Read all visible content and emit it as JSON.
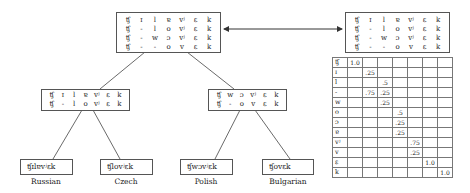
{
  "root_alignment": {
    "rows": [
      [
        "ʧ",
        "ɪ",
        "l",
        "ɐ",
        "vʲ",
        "ɛ",
        "k"
      ],
      [
        "ʧ",
        "-",
        "l",
        "o",
        "vʲ",
        "ɛ",
        "k"
      ],
      [
        "ʧ",
        "-",
        "w",
        "ɔ",
        "vʲ",
        "ɛ",
        "k"
      ],
      [
        "ʧ",
        "-",
        "-",
        "o",
        "v",
        "ɛ",
        "k"
      ]
    ]
  },
  "profile_alignment": {
    "rows": [
      [
        "ʧ",
        "ɪ",
        "l",
        "ɐ",
        "vʲ",
        "ɛ",
        "k"
      ],
      [
        "ʧ",
        "-",
        "l",
        "o",
        "vʲ",
        "ɛ",
        "k"
      ],
      [
        "ʧ",
        "-",
        "w",
        "ɔ",
        "vʲ",
        "ɛ",
        "k"
      ],
      [
        "ʧ",
        "-",
        "-",
        "o",
        "v",
        "ɛ",
        "k"
      ]
    ]
  },
  "left_alignment": {
    "rows": [
      [
        "ʧ",
        "ɪ",
        "l",
        "ɐ",
        "vʲ",
        "ɛ",
        "k"
      ],
      [
        "ʧ",
        "-",
        "l",
        "o",
        "vʲ",
        "ɛ",
        "k"
      ]
    ]
  },
  "right_alignment": {
    "rows": [
      [
        "ʧ",
        "w",
        "ɔ",
        "vʲ",
        "ɛ",
        "k"
      ],
      [
        "ʧ",
        "-",
        "o",
        "v",
        "ɛ",
        "k"
      ]
    ]
  },
  "leaves": [
    {
      "word": "ʧɪlɐvʲɛk",
      "language": "Russian"
    },
    {
      "word": "ʧlovʲɛk",
      "language": "Czech"
    },
    {
      "word": "ʧwɔvʲɛk",
      "language": "Polish"
    },
    {
      "word": "ʧovɛk",
      "language": "Bulgarian"
    }
  ],
  "profile_matrix": {
    "row_labels": [
      "ʧ",
      "ɪ",
      "l",
      "-",
      "w",
      "o",
      "ɔ",
      "ɐ",
      "vʲ",
      "v",
      "ɛ",
      "k"
    ],
    "cells": [
      [
        "1.0",
        "",
        "",
        "",
        "",
        "",
        ""
      ],
      [
        "",
        ".25",
        "",
        "",
        "",
        "",
        ""
      ],
      [
        "",
        "",
        ".5",
        "",
        "",
        "",
        ""
      ],
      [
        "",
        ".75",
        ".25",
        "",
        "",
        "",
        ""
      ],
      [
        "",
        "",
        ".25",
        "",
        "",
        "",
        ""
      ],
      [
        "",
        "",
        "",
        ".5",
        "",
        "",
        ""
      ],
      [
        "",
        "",
        "",
        ".25",
        "",
        "",
        ""
      ],
      [
        "",
        "",
        "",
        ".25",
        "",
        "",
        ""
      ],
      [
        "",
        "",
        "",
        "",
        ".75",
        "",
        ""
      ],
      [
        "",
        "",
        "",
        "",
        ".25",
        "",
        ""
      ],
      [
        "",
        "",
        "",
        "",
        "",
        "1.0",
        ""
      ],
      [
        "",
        "",
        "",
        "",
        "",
        "",
        "1.0"
      ]
    ]
  }
}
